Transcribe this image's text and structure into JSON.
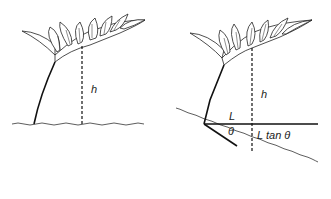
{
  "figure": {
    "left_panel": {
      "height_label": "h"
    },
    "right_panel": {
      "height_label": "h",
      "horizontal_label": "L",
      "angle_label": "θ",
      "offset_label": "L tan θ"
    }
  }
}
